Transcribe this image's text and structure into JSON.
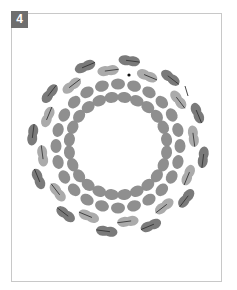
{
  "figure": {
    "step_number": "4",
    "type": "beadwork ring diagram"
  },
  "colors": {
    "frame_border": "#c8c8c8",
    "badge_bg": "#6e6e6e",
    "badge_text": "#ffffff",
    "bead_dark": "#7a7a7a",
    "bead_light": "#ababab",
    "bead_mid": "#8f8f8f",
    "thread": "#333333"
  },
  "ring": {
    "center": [
      118,
      146
    ],
    "outer_groups": 12,
    "outer_dark_radius": 86,
    "outer_light_radius": 76,
    "middle_radius": 62,
    "middle_count": 24,
    "inner_radius": 49,
    "inner_count": 24
  },
  "markers": {
    "needle_dot": [
      129,
      75
    ],
    "thread_end": [
      185,
      86
    ]
  }
}
